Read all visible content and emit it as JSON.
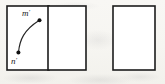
{
  "figure": {
    "background_color": "#f7f6f3",
    "ink_color": "#1c1c1c",
    "panels": [
      {
        "id": "panel-left",
        "x": 7,
        "y": 6,
        "width": 42,
        "height": 64
      },
      {
        "id": "panel-middle",
        "x": 48,
        "y": 6,
        "width": 38,
        "height": 64
      },
      {
        "id": "panel-right",
        "x": 113,
        "y": 6,
        "width": 42,
        "height": 64
      }
    ],
    "arc": {
      "label": "curve-m-prime-n-prime",
      "path": "M 18.5 52.5 C 19.5 40 24 30 39 20.5",
      "stroke_color": "#242424"
    },
    "points": [
      {
        "id": "point-m-prime",
        "letter": "m",
        "prime": "′",
        "cx": 39.5,
        "cy": 20.3,
        "radius": 2.0,
        "label_x": 22,
        "label_y": 16
      },
      {
        "id": "point-n-prime",
        "letter": "n",
        "prime": "′",
        "cx": 18.4,
        "cy": 52.6,
        "radius": 2.0,
        "label_x": 11,
        "label_y": 64
      }
    ]
  }
}
